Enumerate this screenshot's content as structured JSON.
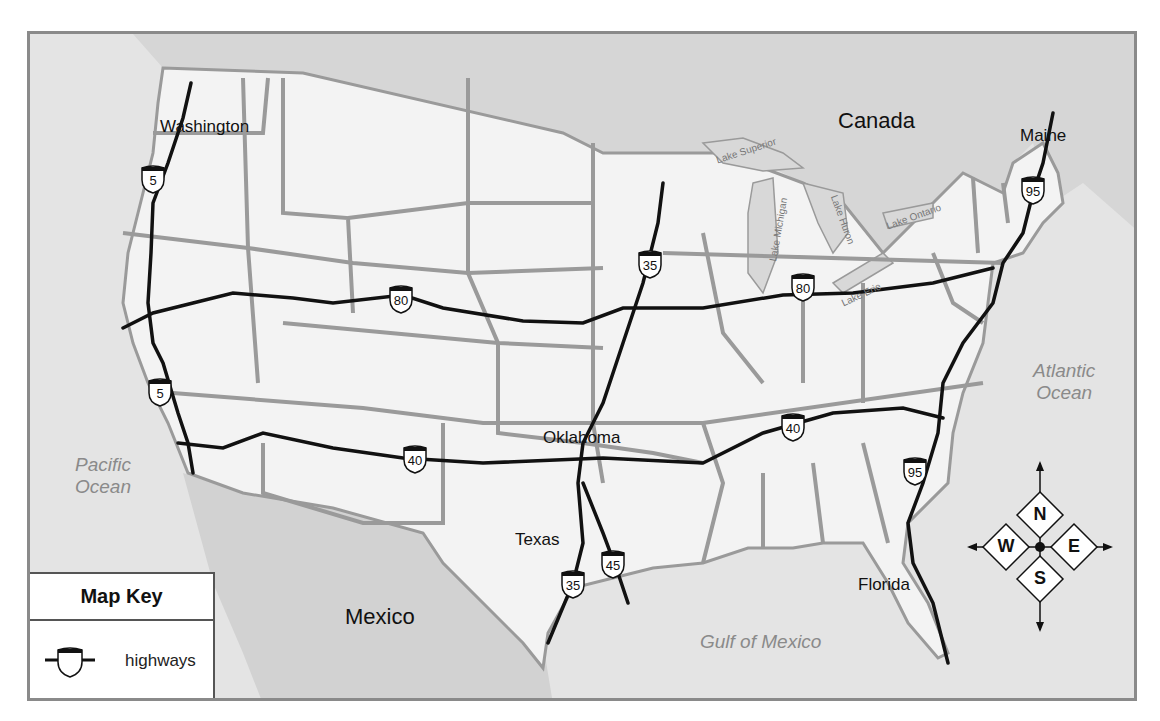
{
  "map": {
    "title_partial": "",
    "countries": [
      {
        "name": "Canada"
      },
      {
        "name": "Mexico"
      }
    ],
    "states": [
      "Washington",
      "Maine",
      "Oklahoma",
      "Texas",
      "Florida"
    ],
    "water_bodies": {
      "pacific": "Pacific Ocean",
      "pacific_line1": "Pacific",
      "pacific_line2": "Ocean",
      "atlantic_line1": "Atlantic",
      "atlantic_line2": "Ocean",
      "gulf": "Gulf of Mexico",
      "lakes": [
        "Lake Superior",
        "Lake Michigan",
        "Lake Huron",
        "Lake Erie",
        "Lake Ontario"
      ]
    },
    "highways": [
      {
        "number": "5",
        "shields": 2
      },
      {
        "number": "80",
        "shields": 2
      },
      {
        "number": "40",
        "shields": 2
      },
      {
        "number": "35",
        "shields": 2
      },
      {
        "number": "45",
        "shields": 1
      },
      {
        "number": "95",
        "shields": 2
      }
    ],
    "shield_labels": {
      "i5_north": "5",
      "i5_south": "5",
      "i80_west": "80",
      "i80_east": "80",
      "i40_west": "40",
      "i40_east": "40",
      "i35_north": "35",
      "i35_south": "35",
      "i45": "45",
      "i95_north": "95",
      "i95_south": "95"
    },
    "labels": {
      "canada": "Canada",
      "mexico": "Mexico",
      "washington": "Washington",
      "maine": "Maine",
      "oklahoma": "Oklahoma",
      "texas": "Texas",
      "florida": "Florida",
      "lake_superior": "Lake Superior",
      "lake_michigan": "Lake Michigan",
      "lake_huron": "Lake Huron",
      "lake_erie": "Lake Erie",
      "lake_ontario": "Lake Ontario"
    },
    "key": {
      "title": "Map Key",
      "items": [
        {
          "symbol": "interstate-shield-icon",
          "label": "highways"
        }
      ]
    },
    "compass": {
      "n": "N",
      "s": "S",
      "e": "E",
      "w": "W"
    },
    "colors": {
      "land": "#f2f2f2",
      "water": "#dcdcdc",
      "foreign_land": "#d2d2d2",
      "border": "#9a9a9a",
      "highway": "#111111"
    }
  }
}
